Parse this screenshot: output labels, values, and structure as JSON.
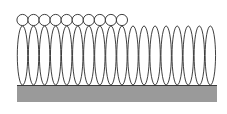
{
  "diagram": {
    "colors": {
      "background": "#ffffff",
      "substrate_fill": "#9a9a9a",
      "substrate_edge": "#3a3a3a",
      "outline": "#2a2a2a"
    },
    "substrate": {
      "x": 17,
      "y": 85,
      "width": 200,
      "height": 17
    },
    "molecules": {
      "count": 18,
      "start_x": 17,
      "pitch": 11.05,
      "width": 11,
      "top_y": 26,
      "bottom_y": 85
    },
    "caps": {
      "count": 10,
      "radius": 5.6,
      "center_y": 20
    }
  }
}
